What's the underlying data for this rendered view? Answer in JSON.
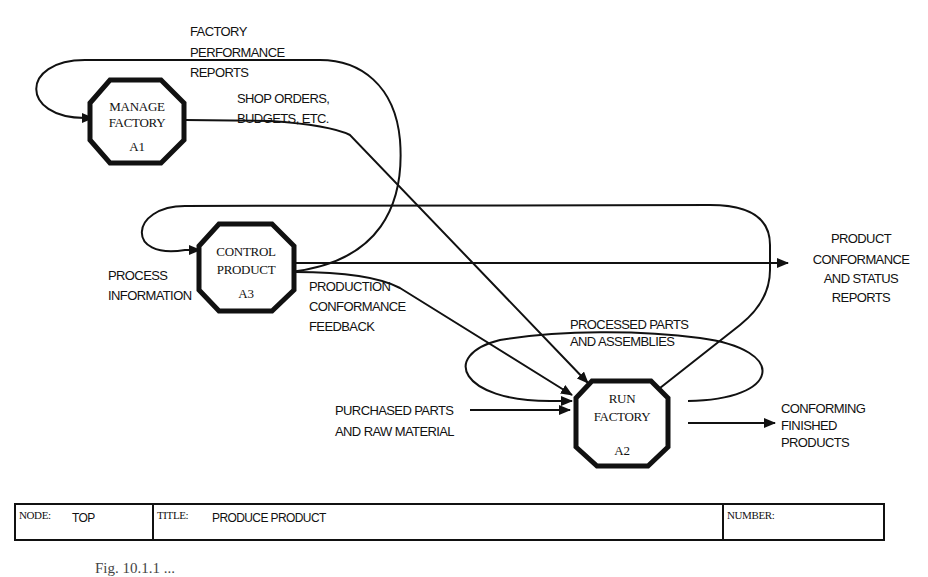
{
  "boxes": [
    {
      "id": "A1",
      "lines": [
        "MANAGE",
        "FACTORY"
      ],
      "code": "A1"
    },
    {
      "id": "A3",
      "lines": [
        "CONTROL",
        "PRODUCT"
      ],
      "code": "A3"
    },
    {
      "id": "A2",
      "lines": [
        "RUN",
        "FACTORY"
      ],
      "code": "A2"
    }
  ],
  "labels": {
    "factory_performance_reports": [
      "FACTORY",
      "PERFORMANCE",
      "REPORTS"
    ],
    "shop_orders": [
      "SHOP ORDERS,",
      "BUDGETS, ETC."
    ],
    "process_information": [
      "PROCESS",
      "INFORMATION"
    ],
    "production_conformance_feedback": [
      "PRODUCTION",
      "CONFORMANCE",
      "FEEDBACK"
    ],
    "product_conformance_reports": [
      "PRODUCT",
      "CONFORMANCE",
      "AND STATUS",
      "REPORTS"
    ],
    "processed_parts": [
      "PROCESSED PARTS",
      "AND ASSEMBLIES"
    ],
    "purchased_parts": [
      "PURCHASED PARTS",
      "AND RAW MATERIAL"
    ],
    "conforming_products": [
      "CONFORMING",
      "FINISHED",
      "PRODUCTS"
    ]
  },
  "title_block": {
    "node_key": "NODE:",
    "node_value": "TOP",
    "title_key": "TITLE:",
    "title_value": "PRODUCE PRODUCT",
    "number_key": "NUMBER:",
    "number_value": ""
  },
  "caption": "Fig. 10.1.1 ..."
}
